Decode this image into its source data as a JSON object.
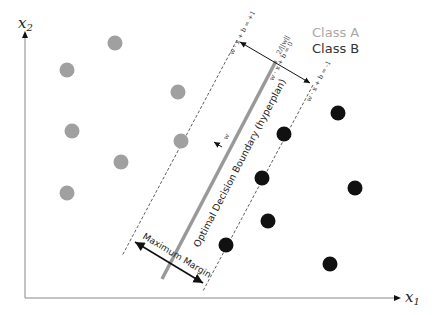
{
  "axes": {
    "x_label": "x",
    "x_sub": "1",
    "y_label": "x",
    "y_sub": "2"
  },
  "legend": {
    "class_a": "Class A",
    "class_b": "Class B",
    "class_a_color": "#a0a0a0",
    "class_b_color": "#111111"
  },
  "lines": {
    "plus_one": "w · x + b = +1",
    "zero": "w · x + b = 0",
    "minus_one": "w · x + b = -1",
    "margin_width": "2/||w||",
    "normal_vector": "w"
  },
  "labels": {
    "boundary": "Optimal Decision Boundary (hyperplan)",
    "margin": "Maximum Margin"
  },
  "points": {
    "class_a": [
      [
        115,
        43
      ],
      [
        67,
        70
      ],
      [
        178,
        92
      ],
      [
        72,
        131
      ],
      [
        181,
        141
      ],
      [
        121,
        162
      ],
      [
        67,
        193
      ]
    ],
    "class_b": [
      [
        338,
        113
      ],
      [
        284,
        134
      ],
      [
        262,
        178
      ],
      [
        355,
        188
      ],
      [
        268,
        221
      ],
      [
        226,
        245
      ],
      [
        330,
        264
      ]
    ]
  }
}
